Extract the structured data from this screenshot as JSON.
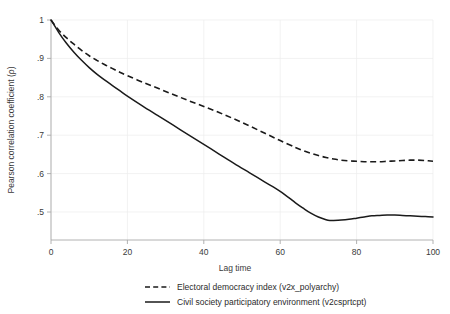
{
  "chart_data": {
    "type": "line",
    "title": "",
    "xlabel": "Lag time",
    "ylabel": "Pearson correlation coefficient (ρ)",
    "xlim": [
      0,
      100
    ],
    "ylim": [
      0.46,
      1.0
    ],
    "xticks": [
      "0",
      "20",
      "40",
      "60",
      "80",
      "100"
    ],
    "xtick_values": [
      0,
      20,
      40,
      60,
      80,
      100
    ],
    "yticks": [
      ".5",
      ".6",
      ".7",
      ".8",
      ".9",
      "1"
    ],
    "ytick_values": [
      0.5,
      0.6,
      0.7,
      0.8,
      0.9,
      1.0
    ],
    "grid": true,
    "grid_axis": "both",
    "legend_position": "below",
    "series": [
      {
        "name": "Electoral democracy index (v2x_polyarchy)",
        "style": "dashed",
        "color": "#1a1a1a",
        "x": [
          0,
          2,
          4,
          6,
          8,
          10,
          12,
          14,
          16,
          18,
          20,
          24,
          28,
          32,
          36,
          40,
          44,
          48,
          52,
          56,
          60,
          64,
          66,
          68,
          70,
          72,
          74,
          76,
          78,
          80,
          82,
          84,
          86,
          88,
          90,
          92,
          94,
          96,
          98,
          100
        ],
        "values": [
          1.0,
          0.974,
          0.954,
          0.937,
          0.921,
          0.907,
          0.895,
          0.884,
          0.874,
          0.864,
          0.855,
          0.838,
          0.822,
          0.806,
          0.79,
          0.775,
          0.759,
          0.742,
          0.724,
          0.705,
          0.686,
          0.668,
          0.66,
          0.653,
          0.647,
          0.642,
          0.638,
          0.635,
          0.633,
          0.632,
          0.631,
          0.631,
          0.631,
          0.632,
          0.633,
          0.634,
          0.635,
          0.635,
          0.634,
          0.632
        ]
      },
      {
        "name": "Civil society participatory environment (v2csprtcpt)",
        "style": "solid",
        "color": "#1a1a1a",
        "x": [
          0,
          2,
          4,
          6,
          8,
          10,
          12,
          14,
          16,
          18,
          20,
          24,
          28,
          32,
          36,
          40,
          44,
          48,
          52,
          56,
          60,
          64,
          66,
          68,
          70,
          72,
          73,
          74,
          76,
          78,
          80,
          82,
          84,
          86,
          88,
          90,
          92,
          94,
          96,
          98,
          100
        ],
        "values": [
          1.0,
          0.968,
          0.94,
          0.916,
          0.895,
          0.876,
          0.859,
          0.844,
          0.83,
          0.816,
          0.802,
          0.776,
          0.751,
          0.726,
          0.701,
          0.676,
          0.651,
          0.626,
          0.602,
          0.578,
          0.554,
          0.524,
          0.51,
          0.497,
          0.487,
          0.48,
          0.478,
          0.478,
          0.479,
          0.481,
          0.484,
          0.487,
          0.49,
          0.491,
          0.492,
          0.492,
          0.491,
          0.49,
          0.489,
          0.488,
          0.487
        ]
      }
    ],
    "annotations": []
  },
  "legend": {
    "entries": [
      {
        "label": "Electoral democracy index (v2x_polyarchy)",
        "style": "dashed"
      },
      {
        "label": "Civil society participatory environment (v2csprtcpt)",
        "style": "solid"
      }
    ]
  }
}
